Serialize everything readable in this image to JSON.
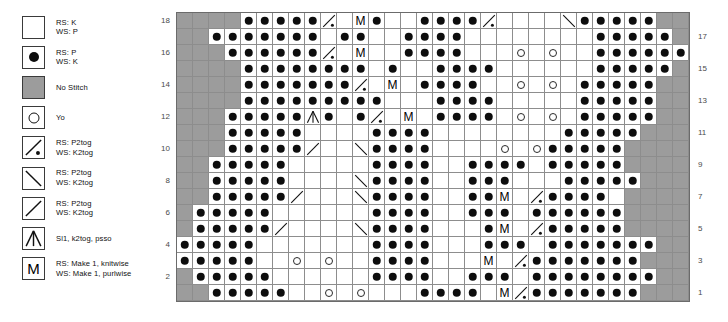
{
  "legend": {
    "title": "Knitting chart legend",
    "items": [
      {
        "symbol": "empty-square",
        "name": "knit",
        "label": "RS: K\nWS: P"
      },
      {
        "symbol": "filled-dot",
        "name": "purl",
        "label": "RS: P\nWS: K"
      },
      {
        "symbol": "gray-square",
        "name": "no-stitch",
        "label": "No Stitch"
      },
      {
        "symbol": "open-circle",
        "name": "yarn-over",
        "label": "Yo"
      },
      {
        "symbol": "slash-dot",
        "name": "p2tog-right",
        "label": "RS: P2tog\nWS: K2tog"
      },
      {
        "symbol": "backslash",
        "name": "p2tog-left",
        "label": "RS: P2tog\nWS: K2tog"
      },
      {
        "symbol": "slash",
        "name": "p2tog-slash",
        "label": "RS: P2tog\nWS: K2tog"
      },
      {
        "symbol": "double-dec",
        "name": "sl1-k2tog-psso",
        "label": "Sl1, k2tog, psso"
      },
      {
        "symbol": "letter-m",
        "name": "make-one",
        "label": "RS: Make 1, knitwise\nWS: Make 1, purlwise"
      }
    ]
  },
  "chart": {
    "columns": 32,
    "rows": 18,
    "row_numbers_left": [
      "18",
      "",
      "16",
      "",
      "14",
      "",
      "12",
      "",
      "10",
      "",
      "8",
      "",
      "6",
      "",
      "4",
      "",
      "2",
      ""
    ],
    "row_numbers_right": [
      "",
      "17",
      "",
      "15",
      "",
      "13",
      "",
      "11",
      "",
      "9",
      "",
      "7",
      "",
      "5",
      "",
      "3",
      "",
      "1"
    ],
    "colors": {
      "no_stitch": "#9c9c9c",
      "background": "#ffffff",
      "grid_line": "#8d8d8d",
      "border": "#6b6b6b",
      "symbol": "#0d0d0d",
      "row_number": "#4a4a4a"
    },
    "symbol_keys": {
      "k": "knit (empty)",
      "p": "purl (filled dot)",
      "n": "no stitch (gray)",
      "o": "yarn over (open circle)",
      "d": "p2tog slash with dot",
      "b": "p2tog backslash",
      "s": "p2tog slash",
      "x": "sl1 k2tog psso",
      "m": "make one (M)"
    },
    "grid": [
      [
        "n",
        "n",
        "n",
        "n",
        "p",
        "p",
        "p",
        "p",
        "p",
        "d",
        "k",
        "m",
        "p",
        "k",
        "k",
        "p",
        "p",
        "p",
        "p",
        "d",
        "k",
        "k",
        "k",
        "k",
        "b",
        "p",
        "p",
        "p",
        "p",
        "p",
        "n",
        "n"
      ],
      [
        "n",
        "n",
        "p",
        "p",
        "p",
        "p",
        "p",
        "p",
        "p",
        "k",
        "p",
        "p",
        "k",
        "k",
        "p",
        "p",
        "p",
        "p",
        "k",
        "k",
        "k",
        "k",
        "k",
        "k",
        "k",
        "k",
        "p",
        "p",
        "p",
        "p",
        "p",
        "n"
      ],
      [
        "n",
        "n",
        "n",
        "p",
        "p",
        "p",
        "p",
        "p",
        "p",
        "d",
        "k",
        "m",
        "k",
        "k",
        "p",
        "p",
        "p",
        "p",
        "k",
        "k",
        "k",
        "o",
        "k",
        "o",
        "k",
        "k",
        "p",
        "p",
        "p",
        "p",
        "p",
        "p"
      ],
      [
        "n",
        "n",
        "n",
        "n",
        "p",
        "p",
        "p",
        "p",
        "p",
        "p",
        "p",
        "p",
        "k",
        "p",
        "k",
        "k",
        "p",
        "p",
        "p",
        "p",
        "k",
        "k",
        "k",
        "k",
        "k",
        "k",
        "p",
        "p",
        "p",
        "p",
        "p",
        "n"
      ],
      [
        "n",
        "n",
        "n",
        "n",
        "p",
        "p",
        "p",
        "p",
        "p",
        "p",
        "p",
        "d",
        "k",
        "m",
        "k",
        "p",
        "p",
        "p",
        "p",
        "k",
        "k",
        "o",
        "k",
        "o",
        "k",
        "p",
        "p",
        "p",
        "p",
        "p",
        "n",
        "n"
      ],
      [
        "n",
        "n",
        "n",
        "n",
        "p",
        "p",
        "p",
        "p",
        "p",
        "p",
        "p",
        "p",
        "p",
        "k",
        "k",
        "k",
        "p",
        "p",
        "p",
        "p",
        "k",
        "k",
        "k",
        "k",
        "k",
        "p",
        "p",
        "p",
        "p",
        "p",
        "n",
        "n"
      ],
      [
        "n",
        "n",
        "n",
        "p",
        "p",
        "p",
        "p",
        "p",
        "x",
        "p",
        "k",
        "p",
        "d",
        "k",
        "m",
        "k",
        "p",
        "p",
        "p",
        "p",
        "k",
        "o",
        "k",
        "o",
        "k",
        "p",
        "p",
        "p",
        "p",
        "p",
        "n",
        "n"
      ],
      [
        "n",
        "n",
        "n",
        "p",
        "p",
        "p",
        "p",
        "p",
        "k",
        "k",
        "k",
        "k",
        "p",
        "p",
        "p",
        "p",
        "k",
        "k",
        "k",
        "k",
        "k",
        "k",
        "k",
        "k",
        "p",
        "p",
        "p",
        "p",
        "p",
        "n",
        "n",
        "n"
      ],
      [
        "n",
        "n",
        "n",
        "p",
        "p",
        "p",
        "p",
        "p",
        "s",
        "k",
        "k",
        "b",
        "p",
        "p",
        "p",
        "p",
        "k",
        "k",
        "k",
        "k",
        "o",
        "k",
        "o",
        "p",
        "p",
        "p",
        "p",
        "p",
        "n",
        "n",
        "n",
        "n"
      ],
      [
        "n",
        "n",
        "p",
        "p",
        "p",
        "p",
        "p",
        "k",
        "k",
        "k",
        "k",
        "k",
        "p",
        "p",
        "p",
        "p",
        "k",
        "k",
        "p",
        "p",
        "p",
        "p",
        "k",
        "p",
        "p",
        "p",
        "p",
        "p",
        "n",
        "n",
        "n",
        "n"
      ],
      [
        "n",
        "n",
        "p",
        "p",
        "p",
        "p",
        "p",
        "k",
        "k",
        "k",
        "k",
        "b",
        "p",
        "p",
        "p",
        "p",
        "k",
        "k",
        "p",
        "p",
        "p",
        "k",
        "k",
        "k",
        "p",
        "p",
        "p",
        "p",
        "p",
        "n",
        "n",
        "n"
      ],
      [
        "n",
        "n",
        "p",
        "p",
        "p",
        "p",
        "p",
        "s",
        "k",
        "k",
        "k",
        "b",
        "p",
        "p",
        "p",
        "p",
        "k",
        "k",
        "p",
        "p",
        "m",
        "k",
        "d",
        "p",
        "p",
        "p",
        "p",
        "k",
        "n",
        "n",
        "n",
        "n"
      ],
      [
        "n",
        "p",
        "p",
        "p",
        "p",
        "p",
        "k",
        "k",
        "k",
        "k",
        "k",
        "k",
        "p",
        "p",
        "p",
        "p",
        "k",
        "k",
        "p",
        "p",
        "p",
        "k",
        "p",
        "p",
        "p",
        "p",
        "p",
        "p",
        "n",
        "n",
        "n",
        "n"
      ],
      [
        "n",
        "p",
        "p",
        "p",
        "p",
        "p",
        "s",
        "k",
        "k",
        "k",
        "k",
        "b",
        "p",
        "p",
        "p",
        "p",
        "k",
        "k",
        "k",
        "p",
        "m",
        "k",
        "d",
        "p",
        "p",
        "p",
        "p",
        "p",
        "n",
        "n",
        "n",
        "n"
      ],
      [
        "p",
        "p",
        "p",
        "p",
        "p",
        "k",
        "k",
        "k",
        "k",
        "k",
        "k",
        "k",
        "p",
        "p",
        "p",
        "p",
        "k",
        "k",
        "k",
        "p",
        "p",
        "p",
        "k",
        "p",
        "p",
        "p",
        "p",
        "p",
        "p",
        "p",
        "n",
        "n"
      ],
      [
        "p",
        "p",
        "p",
        "p",
        "p",
        "k",
        "k",
        "o",
        "k",
        "o",
        "k",
        "k",
        "p",
        "p",
        "p",
        "p",
        "k",
        "k",
        "k",
        "m",
        "k",
        "d",
        "p",
        "p",
        "p",
        "p",
        "p",
        "p",
        "p",
        "n",
        "n",
        "n"
      ],
      [
        "n",
        "p",
        "p",
        "p",
        "p",
        "p",
        "k",
        "k",
        "k",
        "k",
        "k",
        "k",
        "p",
        "p",
        "p",
        "p",
        "k",
        "k",
        "p",
        "p",
        "p",
        "k",
        "p",
        "p",
        "p",
        "p",
        "p",
        "p",
        "p",
        "p",
        "n",
        "n"
      ],
      [
        "n",
        "n",
        "p",
        "p",
        "p",
        "p",
        "p",
        "k",
        "k",
        "o",
        "k",
        "o",
        "k",
        "k",
        "k",
        "p",
        "p",
        "p",
        "p",
        "k",
        "m",
        "d",
        "p",
        "p",
        "p",
        "p",
        "p",
        "p",
        "p",
        "n",
        "n",
        "n"
      ]
    ]
  }
}
